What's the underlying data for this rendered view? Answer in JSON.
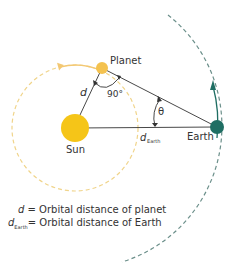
{
  "diagram": {
    "bodies": {
      "sun": {
        "label": "Sun",
        "color": "#f5c518"
      },
      "planet": {
        "label": "Planet",
        "color": "#f4c24f"
      },
      "earth": {
        "label": "Earth",
        "color": "#1f6e63"
      }
    },
    "labels": {
      "d": "d",
      "angle_right": "90°",
      "theta": "θ",
      "d_earth_main": "d",
      "d_earth_sub": "Earth"
    },
    "orbits": {
      "planet_orbit_color": "#f0d48a",
      "earth_orbit_color": "#6b8f8a"
    },
    "line_color": "#333333"
  },
  "legend": {
    "row1": {
      "symbol": "d",
      "sub": "",
      "text": " = Orbital distance of planet"
    },
    "row2": {
      "symbol": "d",
      "sub": "Earth",
      "text": "= Orbital distance of Earth"
    }
  }
}
